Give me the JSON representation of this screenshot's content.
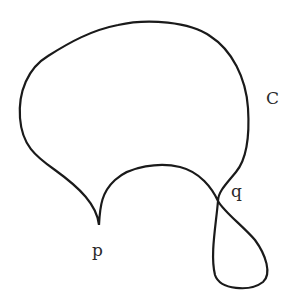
{
  "diagram": {
    "type": "closed-curve-with-cusp-and-self-intersection",
    "stroke_color": "#1a1a1a",
    "background": "#ffffff",
    "labels": {
      "curve": "C",
      "crossing_point": "q",
      "cusp_point": "p"
    },
    "points": {
      "cusp_p": [
        99,
        225
      ],
      "crossing_q": [
        218,
        201
      ]
    }
  }
}
